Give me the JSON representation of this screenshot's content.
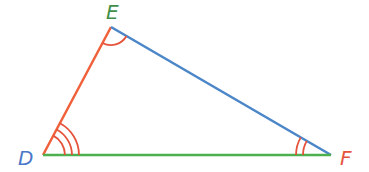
{
  "diagram": {
    "type": "triangle",
    "vertices": {
      "D": {
        "label": "D",
        "x": 43,
        "y": 155,
        "label_color": "#4a78c8"
      },
      "E": {
        "label": "E",
        "x": 111,
        "y": 27,
        "label_color": "#3f8f48"
      },
      "F": {
        "label": "F",
        "x": 331,
        "y": 155,
        "label_color": "#e5533b"
      }
    },
    "sides": {
      "DE": {
        "color": "#f0603a"
      },
      "EF": {
        "color": "#4a86c8"
      },
      "DF": {
        "color": "#4caf50"
      }
    },
    "angle_marks": {
      "D": {
        "arcs": 3,
        "color": "#e5533b"
      },
      "E": {
        "arcs": 1,
        "color": "#e5533b"
      },
      "F": {
        "arcs": 2,
        "color": "#e5533b"
      }
    }
  }
}
